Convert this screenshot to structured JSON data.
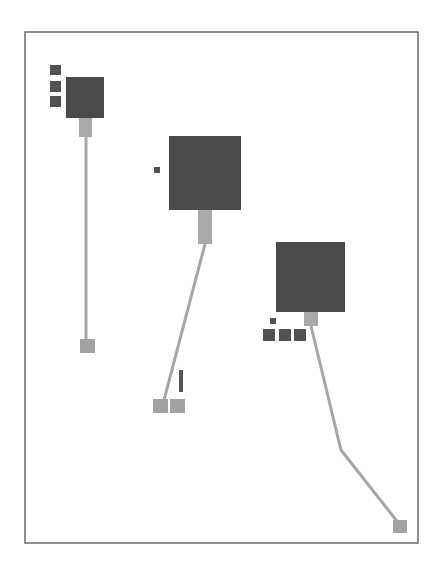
{
  "canvas": {
    "width": 445,
    "height": 563,
    "background": "#ffffff"
  },
  "colors": {
    "frame": "#6a6a6a",
    "node_dark": "#4a4a4a",
    "node_small": "#525252",
    "connector": "#a9a9a9",
    "line": "#a6a6a6",
    "endpoint": "#a2a2a2",
    "figure": "#555555"
  },
  "frame": {
    "x": 25,
    "y": 32,
    "width": 393,
    "height": 511
  },
  "groups": [
    {
      "id": "group-1",
      "main_node": {
        "x": 66,
        "y": 77,
        "w": 38,
        "h": 41
      },
      "connector": {
        "x": 79,
        "y": 118,
        "w": 13,
        "h": 19
      },
      "small_nodes": [
        {
          "x": 50,
          "y": 65,
          "w": 11,
          "h": 10
        },
        {
          "x": 50,
          "y": 81,
          "w": 11,
          "h": 11
        },
        {
          "x": 50,
          "y": 96,
          "w": 11,
          "h": 11
        }
      ],
      "line": [
        [
          86,
          137
        ],
        [
          86,
          339
        ]
      ],
      "endpoints": [
        {
          "x": 80,
          "y": 339,
          "w": 15,
          "h": 14
        }
      ]
    },
    {
      "id": "group-2",
      "main_node": {
        "x": 169,
        "y": 136,
        "w": 72,
        "h": 74
      },
      "connector": {
        "x": 198,
        "y": 210,
        "w": 14,
        "h": 34
      },
      "small_nodes": [
        {
          "x": 154,
          "y": 167,
          "w": 6,
          "h": 6
        }
      ],
      "line": [
        [
          205,
          244
        ],
        [
          164,
          400
        ]
      ],
      "endpoints": [
        {
          "x": 153,
          "y": 399,
          "w": 15,
          "h": 14
        },
        {
          "x": 170,
          "y": 399,
          "w": 15,
          "h": 14
        }
      ],
      "figure": {
        "x": 179,
        "y": 370,
        "w": 4,
        "h": 22
      }
    },
    {
      "id": "group-3",
      "main_node": {
        "x": 276,
        "y": 242,
        "w": 69,
        "h": 70
      },
      "connector": {
        "x": 304,
        "y": 312,
        "w": 14,
        "h": 14
      },
      "small_nodes": [
        {
          "x": 270,
          "y": 318,
          "w": 6,
          "h": 6
        },
        {
          "x": 263,
          "y": 329,
          "w": 12,
          "h": 12
        },
        {
          "x": 279,
          "y": 329,
          "w": 12,
          "h": 12
        },
        {
          "x": 294,
          "y": 329,
          "w": 12,
          "h": 12
        }
      ],
      "line": [
        [
          311,
          326
        ],
        [
          341,
          450
        ],
        [
          400,
          525
        ]
      ],
      "endpoints": [
        {
          "x": 393,
          "y": 520,
          "w": 14,
          "h": 13
        }
      ]
    }
  ]
}
